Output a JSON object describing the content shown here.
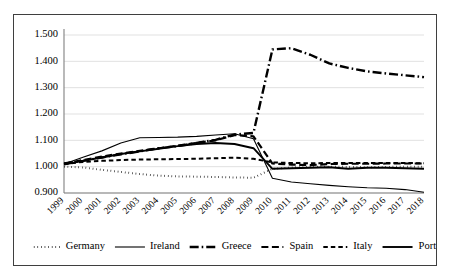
{
  "chart_data": {
    "type": "line",
    "title": "",
    "subtitle": "",
    "xlabel": "",
    "ylabel": "",
    "grid": true,
    "legend_position": "bottom",
    "ylim": [
      0.9,
      1.5
    ],
    "ytick_labels": [
      "1.500",
      "1.400",
      "1.300",
      "1.200",
      "1.100",
      "1.000",
      "0.900"
    ],
    "ytick_values": [
      1.5,
      1.4,
      1.3,
      1.2,
      1.1,
      1.0,
      0.9
    ],
    "categories": [
      "1999",
      "2000",
      "2001",
      "2002",
      "2003",
      "2004",
      "2005",
      "2006",
      "2007",
      "2008",
      "2009",
      "2010",
      "2011",
      "2012",
      "2013",
      "2014",
      "2015",
      "2016",
      "2017",
      "2018"
    ],
    "series": [
      {
        "name": "Germany",
        "style": "dotted",
        "stroke_width": 2.0,
        "dash": "0.6,3.0",
        "values": [
          1.0,
          0.997,
          0.988,
          0.98,
          0.972,
          0.966,
          0.963,
          0.962,
          0.961,
          0.959,
          0.958,
          0.992,
          0.997,
          0.999,
          1.0,
          0.999,
          0.998,
          0.999,
          1.0,
          1.0
        ]
      },
      {
        "name": "Ireland",
        "style": "solid-thin",
        "stroke_width": 1.1,
        "dash": "",
        "values": [
          1.01,
          1.036,
          1.06,
          1.09,
          1.11,
          1.111,
          1.112,
          1.115,
          1.12,
          1.125,
          1.106,
          0.956,
          0.942,
          0.935,
          0.929,
          0.924,
          0.92,
          0.918,
          0.913,
          0.903
        ]
      },
      {
        "name": "Greece",
        "style": "dash-dot",
        "stroke_width": 2.4,
        "dash": "9,3,1.6,3",
        "values": [
          1.012,
          1.022,
          1.035,
          1.047,
          1.058,
          1.07,
          1.078,
          1.09,
          1.102,
          1.122,
          1.128,
          1.445,
          1.45,
          1.425,
          1.392,
          1.375,
          1.362,
          1.354,
          1.347,
          1.34
        ]
      },
      {
        "name": "Spain",
        "style": "dashed-long",
        "stroke_width": 2.2,
        "dash": "7,3.5",
        "values": [
          1.011,
          1.025,
          1.038,
          1.05,
          1.06,
          1.07,
          1.08,
          1.09,
          1.1,
          1.12,
          1.115,
          1.012,
          1.008,
          1.006,
          1.01,
          1.011,
          1.011,
          1.012,
          1.012,
          1.012
        ]
      },
      {
        "name": "Italy",
        "style": "dashed-short",
        "stroke_width": 2.0,
        "dash": "4.5,3",
        "values": [
          1.01,
          1.018,
          1.022,
          1.025,
          1.027,
          1.028,
          1.029,
          1.03,
          1.032,
          1.034,
          1.03,
          1.016,
          1.014,
          1.013,
          1.014,
          1.014,
          1.014,
          1.014,
          1.014,
          1.013
        ]
      },
      {
        "name": "Portugal",
        "style": "solid",
        "stroke_width": 1.9,
        "dash": "",
        "values": [
          1.008,
          1.022,
          1.035,
          1.048,
          1.058,
          1.068,
          1.078,
          1.086,
          1.09,
          1.086,
          1.07,
          0.992,
          0.994,
          0.996,
          0.998,
          0.992,
          0.996,
          0.996,
          0.994,
          0.992
        ]
      }
    ],
    "legend": [
      {
        "label": "Germany",
        "style": "dotted"
      },
      {
        "label": "Ireland",
        "style": "solid-thin"
      },
      {
        "label": "Greece",
        "style": "dash-dot"
      },
      {
        "label": "Spain",
        "style": "dashed-long"
      },
      {
        "label": "Italy",
        "style": "dashed-short"
      },
      {
        "label": "Portugal",
        "style": "solid"
      }
    ]
  },
  "colors": {
    "series_stroke": "#000000",
    "gridline": "#d9d9d9",
    "axis": "#808080",
    "border": "#3f3f3f",
    "background": "#ffffff"
  }
}
